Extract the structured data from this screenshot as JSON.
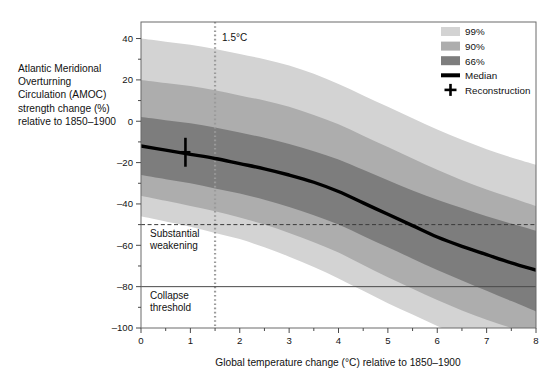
{
  "figure": {
    "background": "#ffffff",
    "plot_background": "#ffffff",
    "frame_color": "#6b6b6b"
  },
  "ylabel_lines": [
    "Atlantic Meridional",
    "Overturning",
    "Circulation (AMOC)",
    "strength change (%)",
    "relative to 1850–1900"
  ],
  "annotations": {
    "warming_marker_label": "1.5°C",
    "substantial_weakening_line1": "Substantial",
    "substantial_weakening_line2": "weakening",
    "collapse_line1": "Collapse",
    "collapse_line2": "threshold"
  },
  "legend": {
    "items": [
      {
        "label": "99%",
        "kind": "swatch",
        "color": "#d3d3d3"
      },
      {
        "label": "90%",
        "kind": "swatch",
        "color": "#adadad"
      },
      {
        "label": "66%",
        "kind": "swatch",
        "color": "#7d7d7d"
      },
      {
        "label": "Median",
        "kind": "line",
        "color": "#000000"
      },
      {
        "label": "Reconstruction",
        "kind": "cross",
        "color": "#000000"
      }
    ]
  },
  "chart_data": {
    "type": "line",
    "title": "",
    "subtitle": "",
    "xlabel": "Global temperature change (°C) relative to 1850–1900",
    "ylabel": "Atlantic Meridional Overturning Circulation (AMOC) strength change (%) relative to 1850–1900",
    "xlim": [
      0,
      8
    ],
    "ylim": [
      -100,
      48
    ],
    "grid": false,
    "legend_position": "top-right",
    "x_ticks": [
      0,
      1,
      2,
      3,
      4,
      5,
      6,
      7,
      8
    ],
    "x_tick_labels": [
      "0",
      "1",
      "2",
      "3",
      "4",
      "5",
      "6",
      "7",
      "8"
    ],
    "x_minor_step": 0.5,
    "y_ticks": [
      40,
      20,
      0,
      -20,
      -40,
      -60,
      -80,
      -100
    ],
    "y_tick_labels": [
      "40",
      "20",
      "0",
      "–20",
      "–40",
      "–60",
      "–80",
      "–100"
    ],
    "y_minor_step": 10,
    "x": [
      0,
      0.5,
      1,
      1.5,
      2,
      2.5,
      3,
      3.5,
      4,
      4.5,
      5,
      5.5,
      6,
      6.5,
      7,
      7.5,
      8
    ],
    "series": [
      {
        "name": "Median",
        "type": "line",
        "color": "#000000",
        "values": [
          -12,
          -14,
          -16,
          -18,
          -20.5,
          -23,
          -26,
          -29.5,
          -34,
          -39.5,
          -45,
          -50.5,
          -56,
          -60.5,
          -64.5,
          -68.5,
          -72
        ]
      },
      {
        "name": "66%",
        "type": "band",
        "color": "#7d7d7d",
        "lower": [
          -26,
          -28,
          -30,
          -32.5,
          -35,
          -38,
          -41.5,
          -45.5,
          -50,
          -55.5,
          -61,
          -66.5,
          -72,
          -77,
          -82,
          -87,
          -92
        ],
        "upper": [
          2,
          0.5,
          -1,
          -3,
          -5.5,
          -8,
          -11,
          -14.5,
          -18.5,
          -23.5,
          -28.5,
          -33.5,
          -38,
          -42,
          -46,
          -49.5,
          -53
        ]
      },
      {
        "name": "90%",
        "type": "band",
        "color": "#adadad",
        "lower": [
          -36,
          -38.5,
          -41,
          -43.5,
          -46.5,
          -50,
          -54,
          -58.5,
          -63.5,
          -69.5,
          -75.5,
          -81,
          -86.5,
          -91.5,
          -96,
          -100,
          -104
        ],
        "upper": [
          20,
          18.5,
          17,
          15,
          12.5,
          10,
          7,
          3,
          -1.5,
          -7,
          -12.5,
          -18,
          -23.5,
          -28.5,
          -33,
          -37,
          -41
        ]
      },
      {
        "name": "99%",
        "type": "band",
        "color": "#d3d3d3",
        "lower": [
          -46,
          -48.5,
          -51,
          -54,
          -57,
          -61,
          -65.5,
          -70.5,
          -76,
          -82,
          -88,
          -93.5,
          -99,
          -104,
          -108,
          -112,
          -116
        ],
        "upper": [
          40,
          38.5,
          37,
          35,
          32.5,
          30,
          27,
          23,
          18,
          12.5,
          7,
          1.5,
          -4,
          -9,
          -13.5,
          -17.5,
          -21
        ]
      }
    ],
    "reference_lines": [
      {
        "name": "warming-1p5",
        "orientation": "vertical",
        "value": 1.5,
        "style": "dotted",
        "color": "#9a9a9a",
        "label": "1.5°C"
      },
      {
        "name": "substantial-weakening",
        "orientation": "horizontal",
        "value": -50,
        "style": "dashed",
        "color": "#3a3a3a",
        "label": "Substantial weakening"
      },
      {
        "name": "collapse-threshold",
        "orientation": "horizontal",
        "value": -80,
        "style": "solid",
        "color": "#4a4a4a",
        "label": "Collapse threshold"
      }
    ],
    "points": [
      {
        "name": "Reconstruction",
        "x": 0.9,
        "y": -15,
        "yerr": 7,
        "marker": "cross",
        "color": "#000000"
      }
    ]
  }
}
